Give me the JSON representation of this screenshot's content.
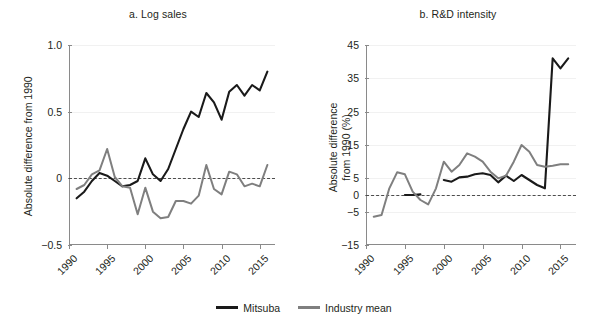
{
  "figure": {
    "series_colors": {
      "mitsuba": "#1a1a1a",
      "industry_mean": "#7f7f7f"
    },
    "legend": [
      {
        "label": "Mitsuba",
        "color": "#1a1a1a"
      },
      {
        "label": "Industry mean",
        "color": "#7f7f7f"
      }
    ]
  },
  "chart_data": [
    {
      "type": "line",
      "panel": "a",
      "title": "a. Log sales",
      "xlabel": "",
      "ylabel": "Absolute difference from 1990",
      "xlim": [
        1990,
        2017
      ],
      "ylim": [
        -0.5,
        1.0
      ],
      "yticks": [
        "1.0",
        "0.5",
        "0",
        "-0.5"
      ],
      "ytick_values": [
        1.0,
        0.5,
        0,
        -0.5
      ],
      "xticks": [
        "1990",
        "1995",
        "2000",
        "2005",
        "2010",
        "2015"
      ],
      "xtick_values": [
        1990,
        1995,
        2000,
        2005,
        2010,
        2015
      ],
      "grid": "horizontal-light",
      "zero_reference_line": 0,
      "legend_position": "bottom-center",
      "series": [
        {
          "name": "Mitsuba",
          "color": "#1a1a1a",
          "x": [
            1991,
            1992,
            1993,
            1994,
            1995,
            1996,
            1997,
            1998,
            1999,
            2000,
            2001,
            2002,
            2003,
            2004,
            2005,
            2006,
            2007,
            2008,
            2009,
            2010,
            2011,
            2012,
            2013,
            2014,
            2015,
            2016
          ],
          "values": [
            -0.15,
            -0.1,
            -0.02,
            0.04,
            0.02,
            -0.02,
            -0.06,
            -0.05,
            -0.02,
            0.15,
            0.03,
            -0.02,
            0.07,
            0.22,
            0.37,
            0.5,
            0.46,
            0.64,
            0.57,
            0.44,
            0.65,
            0.7,
            0.62,
            0.7,
            0.66,
            0.8
          ]
        },
        {
          "name": "Industry mean",
          "color": "#7f7f7f",
          "x": [
            1991,
            1992,
            1993,
            1994,
            1995,
            1996,
            1997,
            1998,
            1999,
            2000,
            2001,
            2002,
            2003,
            2004,
            2005,
            2006,
            2007,
            2008,
            2009,
            2010,
            2011,
            2012,
            2013,
            2014,
            2015,
            2016
          ],
          "values": [
            -0.08,
            -0.05,
            0.03,
            0.06,
            0.22,
            0.01,
            -0.06,
            -0.07,
            -0.27,
            -0.07,
            -0.25,
            -0.3,
            -0.29,
            -0.17,
            -0.17,
            -0.19,
            -0.13,
            0.1,
            -0.08,
            -0.12,
            0.05,
            0.03,
            -0.06,
            -0.04,
            -0.06,
            0.1
          ]
        }
      ]
    },
    {
      "type": "line",
      "panel": "b",
      "title": "b. R&D intensity",
      "xlabel": "",
      "ylabel": "Absolute difference from 1990 (%)",
      "xlim": [
        1990,
        2017
      ],
      "ylim": [
        -15,
        45
      ],
      "yticks": [
        "45",
        "35",
        "25",
        "15",
        "5",
        "0",
        "-5",
        "-15"
      ],
      "ytick_values": [
        45,
        35,
        25,
        15,
        5,
        0,
        -5,
        -15
      ],
      "xticks": [
        "1990",
        "1995",
        "2000",
        "2005",
        "2010",
        "2015"
      ],
      "xtick_values": [
        1990,
        1995,
        2000,
        2005,
        2010,
        2015
      ],
      "grid": "horizontal-light",
      "zero_reference_line": 0,
      "legend_position": "bottom-center",
      "series": [
        {
          "name": "Mitsuba",
          "color": "#1a1a1a",
          "segments": [
            {
              "x": [
                1995,
                1996,
                1997
              ],
              "values": [
                0.0,
                0.0,
                0.2
              ]
            },
            {
              "x": [
                2000,
                2001,
                2002,
                2003,
                2004,
                2005,
                2006,
                2007,
                2008,
                2009,
                2010,
                2011,
                2012,
                2013,
                2014,
                2015,
                2016
              ],
              "values": [
                4.5,
                4.0,
                5.3,
                5.5,
                6.2,
                6.5,
                6.0,
                3.8,
                5.8,
                4.2,
                6.0,
                4.5,
                3.0,
                2.0,
                41.0,
                38.0,
                41.0
              ]
            }
          ]
        },
        {
          "name": "Industry mean",
          "color": "#7f7f7f",
          "x": [
            1991,
            1992,
            1993,
            1994,
            1995,
            1996,
            1997,
            1998,
            1999,
            2000,
            2001,
            2002,
            2003,
            2004,
            2005,
            2006,
            2007,
            2008,
            2009,
            2010,
            2011,
            2012,
            2013,
            2014,
            2015,
            2016
          ],
          "values": [
            -6.5,
            -6.0,
            2.0,
            6.8,
            6.2,
            1.0,
            -1.5,
            -2.8,
            2.0,
            10.0,
            7.0,
            9.0,
            12.5,
            11.5,
            10.0,
            7.0,
            5.0,
            5.8,
            10.0,
            15.0,
            13.0,
            9.0,
            8.5,
            8.8,
            9.2,
            9.2
          ]
        }
      ]
    }
  ]
}
